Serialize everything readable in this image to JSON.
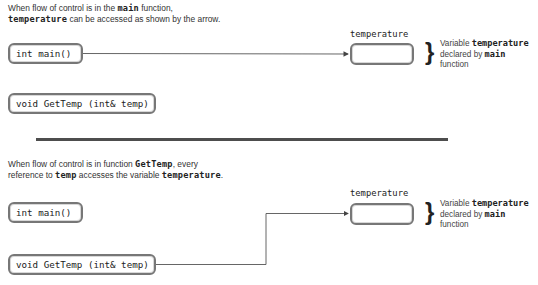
{
  "panel_top": {
    "caption": {
      "line1_pre": "When flow of control is in the ",
      "line1_code": "main",
      "line1_post": " function,",
      "line2_code": "temperature",
      "line2_post": " can be accessed as shown by the arrow."
    },
    "main_box": "int main()",
    "gettemp_box": "void GetTemp (int& temp)",
    "variable_label": "temperature",
    "note": {
      "line1_pre": "Variable ",
      "line1_code": "temperature",
      "line2_pre": "declared by ",
      "line2_code": "main",
      "line3": "function"
    }
  },
  "panel_bottom": {
    "caption": {
      "line1_pre": "When flow of control is in function ",
      "line1_code": "GetTemp",
      "line1_post": ", every",
      "line2_pre": "reference to ",
      "line2_code": "temp",
      "line2_mid": " accesses the variable ",
      "line2_code2": "temperature",
      "line2_post": "."
    },
    "main_box": "int main()",
    "gettemp_box": "void GetTemp (int& temp)",
    "variable_label": "temperature",
    "note": {
      "line1_pre": "Variable ",
      "line1_code": "temperature",
      "line2_pre": "declared by ",
      "line2_code": "main",
      "line3": "function"
    }
  },
  "colors": {
    "box_border": "#777777",
    "divider": "#4d4d4d",
    "arrow": "#444444"
  }
}
